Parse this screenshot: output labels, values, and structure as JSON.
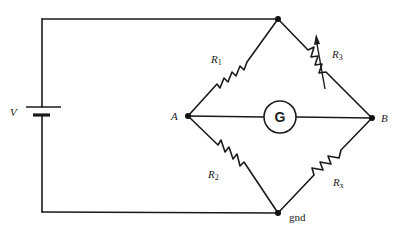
{
  "diagram": {
    "source": {
      "label": "V",
      "type": "battery"
    },
    "nodes": [
      {
        "id": "top",
        "label": ""
      },
      {
        "id": "A",
        "label": "A"
      },
      {
        "id": "B",
        "label": "B"
      },
      {
        "id": "gnd",
        "label": "gnd"
      }
    ],
    "components": [
      {
        "id": "R1",
        "label_main": "R",
        "label_sub": "1",
        "type": "resistor",
        "from": "A",
        "to": "top"
      },
      {
        "id": "R3",
        "label_main": "R",
        "label_sub": "3",
        "type": "variable-resistor",
        "from": "top",
        "to": "B"
      },
      {
        "id": "R2",
        "label_main": "R",
        "label_sub": "2",
        "type": "resistor",
        "from": "A",
        "to": "gnd"
      },
      {
        "id": "Rx",
        "label_main": "R",
        "label_sub": "x",
        "type": "resistor",
        "from": "gnd",
        "to": "B"
      },
      {
        "id": "G",
        "label": "G",
        "type": "galvanometer",
        "from": "A",
        "to": "B"
      }
    ]
  }
}
